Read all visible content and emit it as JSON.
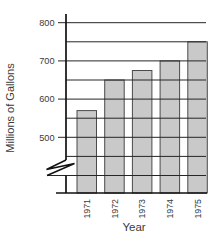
{
  "chart_data": {
    "type": "bar",
    "title": "",
    "categories": [
      "1971",
      "1972",
      "1973",
      "1974",
      "1975"
    ],
    "values": [
      570,
      650,
      675,
      700,
      750
    ],
    "xlabel": "Year",
    "ylabel": "Millions of Gallons",
    "y_axis": {
      "labeled_ticks": [
        500,
        600,
        700,
        800
      ],
      "grid_min": 400,
      "grid_max": 800,
      "grid_step": 50,
      "axis_break": true,
      "break_note": "axis broken between 0 and ~400"
    },
    "grid": "horizontal",
    "legend": "none",
    "colors": {
      "background": "#ffffff",
      "bar_fill": "#c9c9c9",
      "bar_stroke": "#4b4b4b",
      "grid_line": "#262626",
      "axis_line": "#111111",
      "text": "#3a3a3a"
    }
  }
}
